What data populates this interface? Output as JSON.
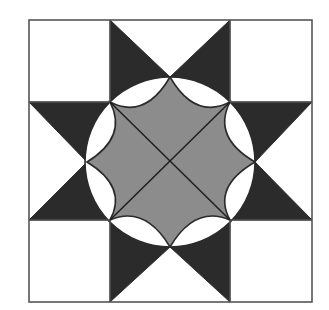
{
  "figure": {
    "colors": {
      "background": "#ffffff",
      "dark": "#2b2b2b",
      "gray": "#8c8c8c",
      "line": "#555555",
      "lens": "#ffffff"
    },
    "outer_square": {
      "x0": 29,
      "y0": 20,
      "x1": 312,
      "y1": 302
    },
    "grid_x": [
      29,
      110,
      230,
      312
    ],
    "grid_y": [
      20,
      102,
      220,
      302
    ],
    "center": [
      170,
      162
    ],
    "circle_radius": 85,
    "star_points": [
      [
        170,
        77
      ],
      [
        255,
        162
      ],
      [
        170,
        247
      ],
      [
        87,
        162
      ]
    ],
    "inner_corners": [
      [
        110,
        102
      ],
      [
        230,
        102
      ],
      [
        230,
        220
      ],
      [
        110,
        220
      ]
    ]
  }
}
